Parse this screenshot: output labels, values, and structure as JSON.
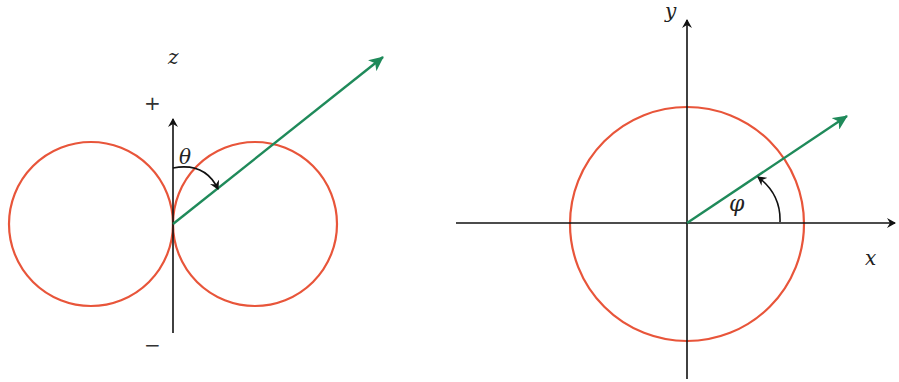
{
  "colors": {
    "pattern": "#e8553a",
    "vector": "#1f8a5a",
    "axis": "#111111",
    "background": "#ffffff"
  },
  "left_panel": {
    "title": "Elevation pattern (dipole, figure-eight)",
    "axis_label": "z",
    "plus_sign": "+",
    "minus_sign": "−",
    "angle_label": "θ",
    "lobes": 2
  },
  "right_panel": {
    "title": "Azimuthal pattern (omnidirectional circle)",
    "x_label": "x",
    "y_label": "y",
    "angle_label": "φ"
  }
}
